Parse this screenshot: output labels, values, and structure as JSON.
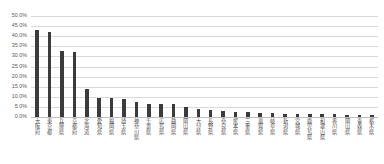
{
  "chart_data": {
    "type": "bar",
    "title": "",
    "subtitle": "",
    "xlabel": "",
    "ylabel": "",
    "ylim": [
      0,
      50
    ],
    "ytick_labels": [
      "50.0%",
      "45.0%",
      "40.0%",
      "35.0%",
      "30.0%",
      "25.0%",
      "20.0%",
      "15.0%",
      "10.0%",
      "5.0%",
      "0.0%"
    ],
    "ytick_values": [
      50,
      45,
      40,
      35,
      30,
      25,
      20,
      15,
      10,
      5,
      0
    ],
    "grid": true,
    "legend": false,
    "legend_position": "none",
    "bar_color": "#3b3b3b",
    "gridline_color": "#d9d9d9",
    "value_suffix": "%",
    "categories": [
      "大阪府",
      "東京都",
      "兵庫県",
      "京都府",
      "北海道",
      "愛知県",
      "福岡県",
      "埼玉県",
      "神奈川県",
      "千葉県",
      "広島県",
      "静岡県",
      "岡山県",
      "大分県",
      "長野県",
      "奈良県",
      "熊本県",
      "三重県",
      "滋賀県",
      "岐阜県",
      "新潟県",
      "宮城県",
      "鹿児島県",
      "和歌山県",
      "香川県",
      "岡山県",
      "青森県",
      "栃木県"
    ],
    "values": [
      43.0,
      42.0,
      32.5,
      32.0,
      14.0,
      9.6,
      9.2,
      9.0,
      7.5,
      6.6,
      6.4,
      6.2,
      5.2,
      4.0,
      3.4,
      3.0,
      2.7,
      2.4,
      2.2,
      2.0,
      1.7,
      1.5,
      1.4,
      1.3,
      1.3,
      1.2,
      1.2,
      1.1
    ]
  }
}
